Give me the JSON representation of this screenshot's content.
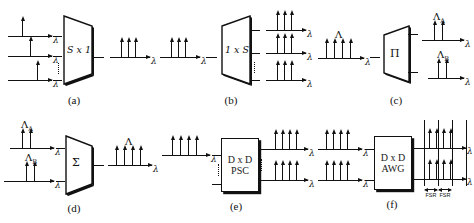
{
  "figure": {
    "lambda_symbol": "λ",
    "big_lambda": "Λ",
    "sigma_symbol": "Σ",
    "pi_symbol": "Π"
  },
  "panels": [
    {
      "id": "a",
      "caption": "(a)",
      "device_label": "S x 1",
      "device_shape": "trapezoid-left-wide",
      "inputs": [
        {
          "arrows": 1,
          "axis_label": "λ",
          "group_label": ""
        },
        {
          "arrows": 1,
          "axis_label": "λ",
          "group_label": ""
        },
        {
          "arrows": 1,
          "axis_label": "λ",
          "group_label": ""
        }
      ],
      "outputs": [
        {
          "arrows": 3,
          "axis_label": "λ",
          "group_label": ""
        }
      ]
    },
    {
      "id": "b",
      "caption": "(b)",
      "device_label": "1 x S",
      "device_shape": "trapezoid-right-wide",
      "inputs": [
        {
          "arrows": 3,
          "axis_label": "λ",
          "group_label": ""
        }
      ],
      "outputs": [
        {
          "arrows": 3,
          "axis_label": "λ",
          "group_label": ""
        },
        {
          "arrows": 3,
          "axis_label": "λ",
          "group_label": ""
        },
        {
          "arrows": 3,
          "axis_label": "λ",
          "group_label": ""
        }
      ]
    },
    {
      "id": "c",
      "caption": "(c)",
      "device_label": "Π",
      "device_shape": "trapezoid-right-wide",
      "inputs": [
        {
          "arrows": 4,
          "axis_label": "λ",
          "group_label": "Λ"
        }
      ],
      "outputs": [
        {
          "arrows": 2,
          "axis_label": "λ",
          "group_label": "Λ",
          "group_sub": "A"
        },
        {
          "arrows": 2,
          "axis_label": "λ",
          "group_label": "Λ",
          "group_sub": "B"
        }
      ]
    },
    {
      "id": "d",
      "caption": "(d)",
      "device_label": "Σ",
      "device_shape": "trapezoid-left-wide",
      "inputs": [
        {
          "arrows": 2,
          "axis_label": "λ",
          "group_label": "Λ",
          "group_sub": "A"
        },
        {
          "arrows": 2,
          "axis_label": "λ",
          "group_label": "Λ",
          "group_sub": "B"
        }
      ],
      "outputs": [
        {
          "arrows": 4,
          "axis_label": "λ",
          "group_label": "Λ"
        }
      ]
    },
    {
      "id": "e",
      "caption": "(e)",
      "device_label_line1": "D x D",
      "device_label_line2": "PSC",
      "device_shape": "rectangle",
      "inputs": [
        {
          "arrows": 4,
          "axis_label": "λ",
          "group_label": ""
        }
      ],
      "outputs": [
        {
          "arrows": 4,
          "axis_label": "λ",
          "group_label": ""
        },
        {
          "arrows": 4,
          "axis_label": "λ",
          "group_label": ""
        }
      ]
    },
    {
      "id": "f",
      "caption": "(f)",
      "device_label_line1": "D x D",
      "device_label_line2": "AWG",
      "device_shape": "rectangle",
      "inputs": [
        {
          "arrows": 4,
          "axis_label": "λ",
          "group_label": ""
        },
        {
          "arrows": 4,
          "axis_label": "λ",
          "group_label": ""
        }
      ],
      "outputs": [
        {
          "arrows": 4,
          "axis_label": "λ",
          "group_label": ""
        },
        {
          "arrows": 4,
          "axis_label": "λ",
          "group_label": ""
        }
      ],
      "fsr_markers": [
        "FSR",
        "FSR"
      ]
    }
  ]
}
